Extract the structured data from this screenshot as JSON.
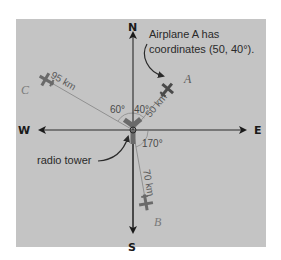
{
  "diagram": {
    "compass": {
      "north": "N",
      "south": "S",
      "east": "E",
      "west": "W"
    },
    "callouts": {
      "airplane_a_line1": "Airplane A has",
      "airplane_a_line2": "coordinates (50, 40°).",
      "tower": "radio tower"
    },
    "airplanes": [
      {
        "id": "A",
        "label": "A",
        "distance_label": "50 km",
        "distance_km": 50,
        "bearing_deg": 40,
        "bearing_label": "40°"
      },
      {
        "id": "B",
        "label": "B",
        "distance_label": "70 km",
        "distance_km": 70,
        "bearing_deg": 170,
        "bearing_label": "170°"
      },
      {
        "id": "C",
        "label": "C",
        "distance_label": "95 km",
        "distance_km": 95,
        "bearing_deg": 300,
        "bearing_label": "60°"
      }
    ]
  }
}
